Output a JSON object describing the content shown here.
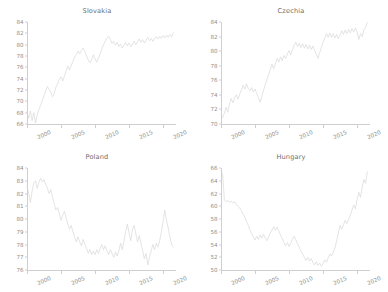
{
  "figure": {
    "layout": "2x2 grid of line charts",
    "caption_clipped": ""
  },
  "chart_data": [
    {
      "type": "line",
      "title": "Slovakia",
      "xlabel": "",
      "ylabel": "",
      "xlim": [
        2000,
        2021.75
      ],
      "ylim": [
        66,
        84
      ],
      "yticks": [
        66,
        68,
        70,
        72,
        74,
        76,
        78,
        80,
        82,
        84
      ],
      "xticks": [
        2000,
        2005,
        2010,
        2015,
        2020
      ],
      "grid": false,
      "legend": "none",
      "line_color": "#d3d3d3",
      "series": [
        {
          "name": "Slovakia",
          "x": [
            2000.0,
            2000.25,
            2000.5,
            2000.75,
            2001.0,
            2001.25,
            2001.5,
            2001.75,
            2002.0,
            2002.25,
            2002.5,
            2002.75,
            2003.0,
            2003.25,
            2003.5,
            2003.75,
            2004.0,
            2004.25,
            2004.5,
            2004.75,
            2005.0,
            2005.25,
            2005.5,
            2005.75,
            2006.0,
            2006.25,
            2006.5,
            2006.75,
            2007.0,
            2007.25,
            2007.5,
            2007.75,
            2008.0,
            2008.25,
            2008.5,
            2008.75,
            2009.0,
            2009.25,
            2009.5,
            2009.75,
            2010.0,
            2010.25,
            2010.5,
            2010.75,
            2011.0,
            2011.25,
            2011.5,
            2011.75,
            2012.0,
            2012.25,
            2012.5,
            2012.75,
            2013.0,
            2013.25,
            2013.5,
            2013.75,
            2014.0,
            2014.25,
            2014.5,
            2014.75,
            2015.0,
            2015.25,
            2015.5,
            2015.75,
            2016.0,
            2016.25,
            2016.5,
            2016.75,
            2017.0,
            2017.25,
            2017.5,
            2017.75,
            2018.0,
            2018.25,
            2018.5,
            2018.75,
            2019.0,
            2019.25,
            2019.5,
            2019.75,
            2020.0,
            2020.25,
            2020.5,
            2020.75,
            2021.0,
            2021.25,
            2021.5
          ],
          "values": [
            68.2,
            67.0,
            68.3,
            66.6,
            68.0,
            66.2,
            67.6,
            68.6,
            69.3,
            70.1,
            71.0,
            71.9,
            72.6,
            72.1,
            71.6,
            70.8,
            71.4,
            72.5,
            73.1,
            73.9,
            74.3,
            73.6,
            74.5,
            75.4,
            76.2,
            75.5,
            76.4,
            77.0,
            77.8,
            78.2,
            78.9,
            78.4,
            79.0,
            79.4,
            78.8,
            78.0,
            77.3,
            76.8,
            77.4,
            78.2,
            77.5,
            76.9,
            77.6,
            78.4,
            79.2,
            80.0,
            80.6,
            81.2,
            81.5,
            80.9,
            80.2,
            80.6,
            79.9,
            80.4,
            79.7,
            80.1,
            79.4,
            79.9,
            80.4,
            79.8,
            80.3,
            79.6,
            80.1,
            80.6,
            80.0,
            80.5,
            81.0,
            80.4,
            80.9,
            80.3,
            80.8,
            81.3,
            80.7,
            81.1,
            80.6,
            81.0,
            81.4,
            81.0,
            81.5,
            81.1,
            81.6,
            81.2,
            81.7,
            81.3,
            81.8,
            81.4,
            82.1
          ]
        }
      ]
    },
    {
      "type": "line",
      "title": "Czechia",
      "xlabel": "",
      "ylabel": "",
      "xlim": [
        2000,
        2021.75
      ],
      "ylim": [
        70,
        84
      ],
      "yticks": [
        70,
        72,
        74,
        76,
        78,
        80,
        82,
        84
      ],
      "xticks": [
        2000,
        2005,
        2010,
        2015,
        2020
      ],
      "grid": false,
      "legend": "none",
      "line_color": "#d3d3d3",
      "series": [
        {
          "name": "Czechia",
          "x": [
            2000.0,
            2000.25,
            2000.5,
            2000.75,
            2001.0,
            2001.25,
            2001.5,
            2001.75,
            2002.0,
            2002.25,
            2002.5,
            2002.75,
            2003.0,
            2003.25,
            2003.5,
            2003.75,
            2004.0,
            2004.25,
            2004.5,
            2004.75,
            2005.0,
            2005.25,
            2005.5,
            2005.75,
            2006.0,
            2006.25,
            2006.5,
            2006.75,
            2007.0,
            2007.25,
            2007.5,
            2007.75,
            2008.0,
            2008.25,
            2008.5,
            2008.75,
            2009.0,
            2009.25,
            2009.5,
            2009.75,
            2010.0,
            2010.25,
            2010.5,
            2010.75,
            2011.0,
            2011.25,
            2011.5,
            2011.75,
            2012.0,
            2012.25,
            2012.5,
            2012.75,
            2013.0,
            2013.25,
            2013.5,
            2013.75,
            2014.0,
            2014.25,
            2014.5,
            2014.75,
            2015.0,
            2015.25,
            2015.5,
            2015.75,
            2016.0,
            2016.25,
            2016.5,
            2016.75,
            2017.0,
            2017.25,
            2017.5,
            2017.75,
            2018.0,
            2018.25,
            2018.5,
            2018.75,
            2019.0,
            2019.25,
            2019.5,
            2019.75,
            2020.0,
            2020.25,
            2020.5,
            2020.75,
            2021.0,
            2021.25,
            2021.5
          ],
          "values": [
            71.3,
            70.9,
            71.5,
            72.3,
            71.6,
            72.8,
            73.5,
            72.9,
            73.6,
            74.0,
            73.4,
            74.1,
            74.7,
            75.3,
            74.8,
            75.5,
            74.9,
            74.6,
            75.0,
            74.4,
            74.8,
            74.2,
            73.6,
            73.0,
            73.8,
            74.6,
            75.4,
            76.1,
            76.8,
            77.5,
            78.2,
            77.6,
            78.3,
            79.0,
            78.5,
            79.2,
            78.7,
            79.4,
            79.0,
            79.6,
            80.1,
            79.5,
            80.2,
            80.8,
            81.2,
            80.6,
            81.1,
            80.5,
            81.0,
            80.4,
            80.9,
            80.3,
            80.8,
            80.2,
            80.7,
            80.1,
            79.6,
            79.0,
            79.8,
            80.5,
            81.2,
            81.8,
            82.4,
            81.9,
            82.5,
            81.9,
            82.4,
            81.8,
            82.3,
            81.7,
            82.2,
            82.8,
            82.3,
            82.9,
            82.4,
            83.0,
            82.5,
            83.1,
            82.6,
            83.2,
            82.7,
            81.6,
            82.4,
            82.0,
            82.9,
            83.3,
            83.9
          ]
        }
      ]
    },
    {
      "type": "line",
      "title": "Poland",
      "xlabel": "",
      "ylabel": "",
      "xlim": [
        2000,
        2021.75
      ],
      "ylim": [
        76,
        84
      ],
      "yticks": [
        76,
        77,
        78,
        79,
        80,
        81,
        82,
        83,
        84
      ],
      "xticks": [
        2000,
        2005,
        2010,
        2015,
        2020
      ],
      "grid": false,
      "legend": "none",
      "line_color": "#d3d3d3",
      "series": [
        {
          "name": "Poland",
          "x": [
            2000.0,
            2000.25,
            2000.5,
            2000.75,
            2001.0,
            2001.25,
            2001.5,
            2001.75,
            2002.0,
            2002.25,
            2002.5,
            2002.75,
            2003.0,
            2003.25,
            2003.5,
            2003.75,
            2004.0,
            2004.25,
            2004.5,
            2004.75,
            2005.0,
            2005.25,
            2005.5,
            2005.75,
            2006.0,
            2006.25,
            2006.5,
            2006.75,
            2007.0,
            2007.25,
            2007.5,
            2007.75,
            2008.0,
            2008.25,
            2008.5,
            2008.75,
            2009.0,
            2009.25,
            2009.5,
            2009.75,
            2010.0,
            2010.25,
            2010.5,
            2010.75,
            2011.0,
            2011.25,
            2011.5,
            2011.75,
            2012.0,
            2012.25,
            2012.5,
            2012.75,
            2013.0,
            2013.25,
            2013.5,
            2013.75,
            2014.0,
            2014.25,
            2014.5,
            2014.75,
            2015.0,
            2015.25,
            2015.5,
            2015.75,
            2016.0,
            2016.25,
            2016.5,
            2016.75,
            2017.0,
            2017.25,
            2017.5,
            2017.75,
            2018.0,
            2018.25,
            2018.5,
            2018.75,
            2019.0,
            2019.25,
            2019.5,
            2019.75,
            2020.0,
            2020.25,
            2020.5,
            2020.75,
            2021.0,
            2021.25,
            2021.5
          ],
          "values": [
            82.6,
            82.0,
            81.3,
            82.2,
            82.8,
            83.0,
            82.4,
            82.9,
            83.2,
            82.9,
            83.1,
            82.7,
            82.4,
            82.0,
            82.3,
            81.7,
            81.2,
            80.7,
            80.9,
            80.4,
            79.9,
            80.3,
            80.6,
            80.1,
            79.6,
            79.2,
            79.5,
            79.0,
            78.6,
            78.2,
            78.6,
            78.2,
            77.9,
            78.4,
            78.0,
            77.7,
            77.3,
            77.6,
            77.2,
            77.5,
            77.2,
            77.6,
            77.3,
            77.7,
            78.0,
            77.6,
            77.9,
            77.5,
            77.2,
            77.6,
            77.3,
            77.0,
            77.4,
            77.1,
            77.5,
            78.1,
            77.6,
            78.3,
            79.0,
            79.6,
            78.9,
            78.3,
            79.2,
            79.5,
            78.8,
            78.2,
            78.7,
            78.1,
            77.5,
            76.9,
            77.3,
            76.4,
            77.0,
            77.5,
            78.0,
            77.6,
            78.1,
            77.8,
            78.3,
            79.0,
            79.8,
            80.7,
            79.9,
            79.3,
            78.6,
            78.0,
            77.8
          ]
        }
      ]
    },
    {
      "type": "line",
      "title": "Hungary",
      "xlabel": "",
      "ylabel": "",
      "xlim": [
        2000,
        2021.75
      ],
      "ylim": [
        50,
        66
      ],
      "yticks": [
        50,
        52,
        54,
        56,
        58,
        60,
        62,
        64,
        66
      ],
      "xticks": [
        2000,
        2005,
        2010,
        2015,
        2020
      ],
      "grid": false,
      "legend": "none",
      "line_color": "#d3d3d3",
      "series": [
        {
          "name": "Hungary",
          "x": [
            2000.0,
            2000.25,
            2000.5,
            2000.75,
            2001.0,
            2001.25,
            2001.5,
            2001.75,
            2002.0,
            2002.25,
            2002.5,
            2002.75,
            2003.0,
            2003.25,
            2003.5,
            2003.75,
            2004.0,
            2004.25,
            2004.5,
            2004.75,
            2005.0,
            2005.25,
            2005.5,
            2005.75,
            2006.0,
            2006.25,
            2006.5,
            2006.75,
            2007.0,
            2007.25,
            2007.5,
            2007.75,
            2008.0,
            2008.25,
            2008.5,
            2008.75,
            2009.0,
            2009.25,
            2009.5,
            2009.75,
            2010.0,
            2010.25,
            2010.5,
            2010.75,
            2011.0,
            2011.25,
            2011.5,
            2011.75,
            2012.0,
            2012.25,
            2012.5,
            2012.75,
            2013.0,
            2013.25,
            2013.5,
            2013.75,
            2014.0,
            2014.25,
            2014.5,
            2014.75,
            2015.0,
            2015.25,
            2015.5,
            2015.75,
            2016.0,
            2016.25,
            2016.5,
            2016.75,
            2017.0,
            2017.25,
            2017.5,
            2017.75,
            2018.0,
            2018.25,
            2018.5,
            2018.75,
            2019.0,
            2019.25,
            2019.5,
            2019.75,
            2020.0,
            2020.25,
            2020.5,
            2020.75,
            2021.0,
            2021.25,
            2021.5
          ],
          "values": [
            65.6,
            64.9,
            61.0,
            60.7,
            60.9,
            60.6,
            60.8,
            60.5,
            60.7,
            60.3,
            60.0,
            59.7,
            59.3,
            58.8,
            58.3,
            57.6,
            57.0,
            56.3,
            55.7,
            55.2,
            54.7,
            55.3,
            54.8,
            55.5,
            55.0,
            55.6,
            55.1,
            54.6,
            55.2,
            55.8,
            56.3,
            56.8,
            56.2,
            56.7,
            56.1,
            55.5,
            54.9,
            54.3,
            53.8,
            54.3,
            53.7,
            54.2,
            54.8,
            55.3,
            54.7,
            54.1,
            53.6,
            53.0,
            52.5,
            52.0,
            51.5,
            52.0,
            51.4,
            51.8,
            51.2,
            50.8,
            51.3,
            50.7,
            51.1,
            50.6,
            51.0,
            51.6,
            51.2,
            51.9,
            52.5,
            52.2,
            52.8,
            53.5,
            54.6,
            55.8,
            57.0,
            56.4,
            57.1,
            57.8,
            57.3,
            57.9,
            58.6,
            59.4,
            60.2,
            59.6,
            61.0,
            62.2,
            61.4,
            63.0,
            64.2,
            63.6,
            65.4
          ]
        }
      ]
    }
  ]
}
